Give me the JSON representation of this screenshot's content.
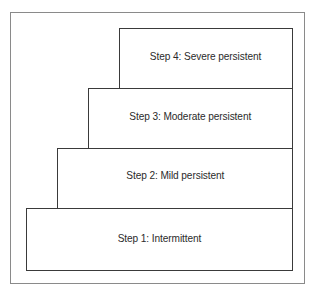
{
  "diagram": {
    "type": "staircase",
    "steps": [
      {
        "label": "Step 1: Intermittent"
      },
      {
        "label": "Step 2: Mild persistent"
      },
      {
        "label": "Step 3: Moderate persistent"
      },
      {
        "label": "Step 4: Severe persistent"
      }
    ]
  }
}
